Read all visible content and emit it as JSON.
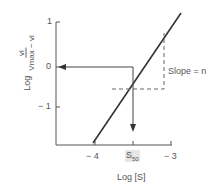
{
  "diagram": {
    "type": "hill-plot",
    "y_axis": {
      "label_prefix": "Log",
      "label_numerator": "vi",
      "label_denominator": "Vmax − vi",
      "ticks": [
        "1",
        "0",
        "− 1"
      ]
    },
    "x_axis": {
      "label": "Log [S]",
      "ticks": [
        "− 4",
        "S50",
        "− 3"
      ],
      "s50_main": "S",
      "s50_sub": "50"
    },
    "annotation": {
      "slope_label": "Slope = n"
    },
    "colors": {
      "line": "#333333",
      "axis": "#555555",
      "text": "#555555",
      "dashed": "#666666"
    }
  }
}
